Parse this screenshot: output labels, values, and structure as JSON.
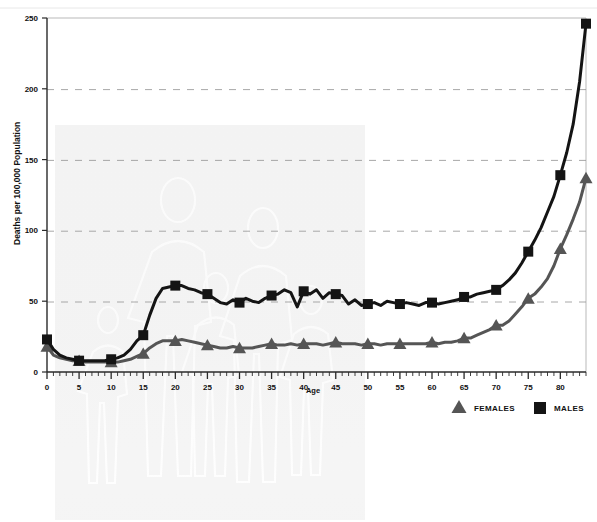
{
  "chart_data": {
    "type": "line",
    "title": "",
    "xlabel": "Age",
    "ylabel": "Deaths per 100,000 Population",
    "xlim": [
      0,
      84
    ],
    "ylim": [
      0,
      250
    ],
    "grid": true,
    "grid_style": "dashed-horizontal",
    "legend_position": "bottom-right",
    "ytick_labels": [
      "0",
      "50",
      "100",
      "150",
      "200",
      "250"
    ],
    "ytick_values": [
      0,
      50,
      100,
      150,
      200,
      250
    ],
    "xtick_labels": [
      "0",
      "5",
      "10",
      "15",
      "20",
      "25",
      "30",
      "35",
      "40",
      "45",
      "50",
      "55",
      "60",
      "65",
      "70",
      "75",
      "80"
    ],
    "xtick_values": [
      0,
      5,
      10,
      15,
      20,
      25,
      30,
      35,
      40,
      45,
      50,
      55,
      60,
      65,
      70,
      75,
      80
    ],
    "minor_xtick_interval": 1,
    "marker_interval": 5,
    "x": [
      0,
      1,
      2,
      3,
      4,
      5,
      6,
      7,
      8,
      9,
      10,
      11,
      12,
      13,
      14,
      15,
      16,
      17,
      18,
      19,
      20,
      21,
      22,
      23,
      24,
      25,
      26,
      27,
      28,
      29,
      30,
      31,
      32,
      33,
      34,
      35,
      36,
      37,
      38,
      39,
      40,
      41,
      42,
      43,
      44,
      45,
      46,
      47,
      48,
      49,
      50,
      51,
      52,
      53,
      54,
      55,
      56,
      57,
      58,
      59,
      60,
      61,
      62,
      63,
      64,
      65,
      66,
      67,
      68,
      69,
      70,
      71,
      72,
      73,
      74,
      75,
      76,
      77,
      78,
      79,
      80,
      81,
      82,
      83,
      84
    ],
    "series": [
      {
        "name": "MALES",
        "marker": "square",
        "color": "#141414",
        "values": [
          23,
          16,
          12,
          10,
          9,
          8,
          8,
          8,
          8,
          8,
          9,
          10,
          12,
          16,
          22,
          26,
          40,
          52,
          59,
          60,
          61,
          61,
          59,
          58,
          56,
          55,
          52,
          49,
          48,
          51,
          49,
          52,
          50,
          49,
          52,
          54,
          55,
          58,
          56,
          46,
          57,
          55,
          58,
          52,
          56,
          55,
          54,
          48,
          51,
          47,
          48,
          49,
          47,
          50,
          49,
          48,
          49,
          48,
          47,
          49,
          49,
          48,
          49,
          50,
          51,
          53,
          53,
          55,
          56,
          57,
          58,
          61,
          65,
          70,
          77,
          85,
          93,
          102,
          113,
          124,
          139,
          155,
          175,
          205,
          246
        ]
      },
      {
        "name": "FEMALES",
        "marker": "triangle",
        "color": "#555555",
        "values": [
          18,
          12,
          10,
          9,
          8,
          8,
          7,
          7,
          7,
          7,
          7,
          7,
          8,
          9,
          11,
          13,
          17,
          20,
          22,
          22,
          22,
          23,
          22,
          21,
          20,
          19,
          18,
          17,
          17,
          18,
          17,
          17,
          17,
          18,
          19,
          20,
          19,
          19,
          20,
          19,
          20,
          20,
          20,
          19,
          20,
          21,
          20,
          20,
          20,
          19,
          20,
          20,
          19,
          20,
          20,
          20,
          20,
          20,
          20,
          20,
          21,
          20,
          21,
          21,
          22,
          24,
          24,
          26,
          28,
          30,
          33,
          33,
          36,
          41,
          46,
          52,
          55,
          60,
          66,
          75,
          87,
          97,
          108,
          120,
          137
        ]
      }
    ]
  },
  "axis": {
    "ylabel": "Deaths per 100,000 Population",
    "xlabel": "Age"
  },
  "legend": {
    "females_label": "FEMALES",
    "males_label": "MALES",
    "females_color": "#555555",
    "males_color": "#141414"
  },
  "watermark": {
    "description": "family-silhouette-watermark",
    "visible": true
  }
}
